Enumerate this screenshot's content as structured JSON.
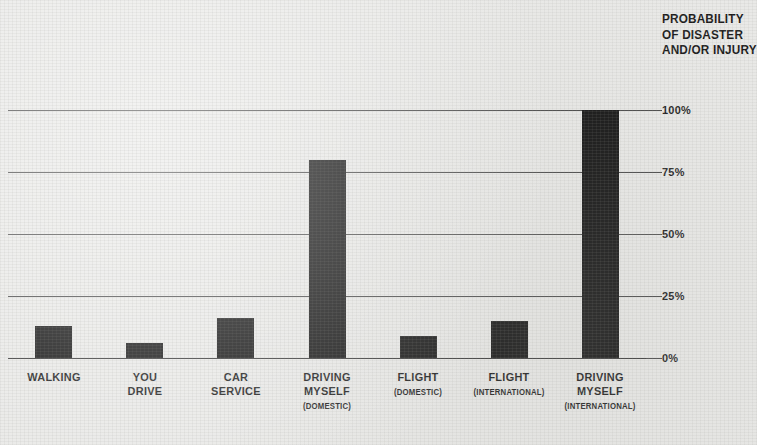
{
  "chart_data": {
    "type": "bar",
    "title": "PROBABILITY OF DISASTER AND/OR INJURY",
    "title_lines": [
      "PROBABILITY",
      "OF DISASTER",
      "AND/OR INJURY"
    ],
    "xlabel": "",
    "ylabel": "PROBABILITY OF DISASTER AND/OR INJURY",
    "ylim": [
      0,
      100
    ],
    "grid": true,
    "legend": "none",
    "y_tick_labels": [
      "100%",
      "75%",
      "50%",
      "25%",
      "0%"
    ],
    "y_tick_values": [
      100,
      75,
      50,
      25,
      0
    ],
    "categories": [
      "WALKING",
      "YOU DRIVE",
      "CAR SERVICE",
      "DRIVING MYSELF (DOMESTIC)",
      "FLIGHT (DOMESTIC)",
      "FLIGHT (INTERNATIONAL)",
      "DRIVING MYSELF (INTERNATIONAL)"
    ],
    "category_lines": [
      {
        "main": [
          "WALKING"
        ],
        "sub": ""
      },
      {
        "main": [
          "YOU",
          "DRIVE"
        ],
        "sub": ""
      },
      {
        "main": [
          "CAR",
          "SERVICE"
        ],
        "sub": ""
      },
      {
        "main": [
          "DRIVING",
          "MYSELF"
        ],
        "sub": "(DOMESTIC)"
      },
      {
        "main": [
          "FLIGHT"
        ],
        "sub": "(DOMESTIC)"
      },
      {
        "main": [
          "FLIGHT"
        ],
        "sub": "(INTERNATIONAL)"
      },
      {
        "main": [
          "DRIVING",
          "MYSELF"
        ],
        "sub": "(INTERNATIONAL)"
      }
    ],
    "values": [
      13,
      6,
      16,
      80,
      9,
      15,
      100
    ],
    "bar_color": "#141414",
    "background_color": "#e9e9e7",
    "axis_color": "#4a4a4a"
  }
}
